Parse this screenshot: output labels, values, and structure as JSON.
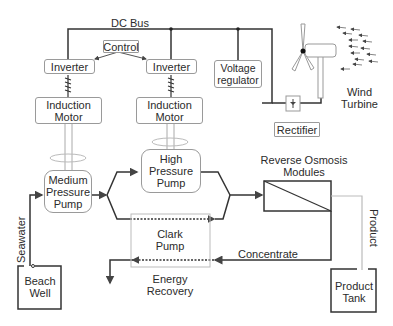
{
  "diagram": {
    "nodes": {
      "dc_bus": "DC Bus",
      "control": "Control",
      "inverter_1": "Inverter",
      "inverter_2": "Inverter",
      "voltage_regulator": "Voltage regulator",
      "induction_motor_1": "Induction Motor",
      "induction_motor_2": "Induction Motor",
      "medium_pressure_pump": "Medium Pressure Pump",
      "high_pressure_pump": "High Pressure Pump",
      "clark_pump": "Clark Pump",
      "energy_recovery": "Energy Recovery",
      "reverse_osmosis_modules": "Reverse Osmosis Modules",
      "rectifier": "Rectifier",
      "wind_turbine": "Wind Turbine",
      "beach_well": "Beach Well",
      "product_tank": "Product Tank"
    },
    "flow_labels": {
      "seawater": "Seawater",
      "product": "Product",
      "concentrate": "Concentrate"
    },
    "edges": [
      {
        "from": "wind_turbine",
        "to": "rectifier"
      },
      {
        "from": "rectifier",
        "to": "dc_bus"
      },
      {
        "from": "dc_bus",
        "to": "inverter_1"
      },
      {
        "from": "dc_bus",
        "to": "inverter_2"
      },
      {
        "from": "dc_bus",
        "to": "voltage_regulator"
      },
      {
        "from": "control",
        "to": "inverter_1"
      },
      {
        "from": "control",
        "to": "inverter_2"
      },
      {
        "from": "inverter_1",
        "to": "induction_motor_1"
      },
      {
        "from": "inverter_2",
        "to": "induction_motor_2"
      },
      {
        "from": "induction_motor_1",
        "to": "medium_pressure_pump"
      },
      {
        "from": "induction_motor_2",
        "to": "high_pressure_pump"
      },
      {
        "from": "beach_well",
        "to": "medium_pressure_pump",
        "label": "Seawater"
      },
      {
        "from": "medium_pressure_pump",
        "to": "high_pressure_pump"
      },
      {
        "from": "medium_pressure_pump",
        "to": "clark_pump"
      },
      {
        "from": "high_pressure_pump",
        "to": "reverse_osmosis_modules"
      },
      {
        "from": "clark_pump",
        "to": "reverse_osmosis_modules"
      },
      {
        "from": "reverse_osmosis_modules",
        "to": "product_tank",
        "label": "Product"
      },
      {
        "from": "reverse_osmosis_modules",
        "to": "clark_pump",
        "label": "Concentrate"
      }
    ]
  }
}
